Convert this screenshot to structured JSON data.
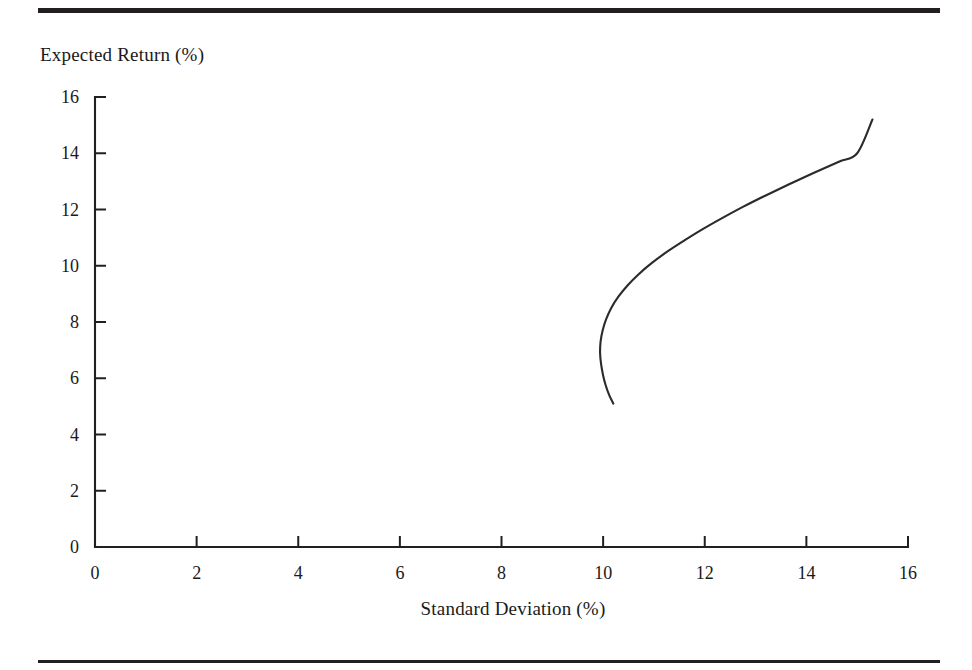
{
  "figure": {
    "top_rule": "horizontal-rule",
    "bottom_rule": "horizontal-rule",
    "y_axis_title": "Expected Return (%)",
    "x_axis_title": "Standard Deviation (%)"
  },
  "chart_data": {
    "type": "line",
    "title": "",
    "subtitle": "",
    "xlabel": "Standard Deviation (%)",
    "ylabel": "Expected Return (%)",
    "xlim": [
      0,
      16
    ],
    "ylim": [
      0,
      16
    ],
    "xticks": [
      0,
      2,
      4,
      6,
      8,
      10,
      12,
      14,
      16
    ],
    "yticks": [
      0,
      2,
      4,
      6,
      8,
      10,
      12,
      14,
      16
    ],
    "xtick_labels": [
      "0",
      "2",
      "4",
      "6",
      "8",
      "10",
      "12",
      "14",
      "16"
    ],
    "ytick_labels": [
      "0",
      "2",
      "4",
      "6",
      "8",
      "10",
      "12",
      "14",
      "16"
    ],
    "grid": false,
    "legend": null,
    "legend_position": "none",
    "tick_direction": "out",
    "series": [
      {
        "name": "Minimum-variance frontier",
        "color": "#2b2b2b",
        "linewidth": 2.1,
        "x": [
          10.2,
          10.12,
          10.05,
          10.0,
          9.96,
          9.94,
          9.95,
          9.99,
          10.06,
          10.16,
          10.3,
          10.48,
          10.7,
          10.96,
          11.26,
          11.6,
          11.96,
          12.35,
          12.76,
          13.2,
          13.66,
          14.14,
          14.64,
          15.0,
          15.3
        ],
        "y": [
          5.1,
          5.4,
          5.75,
          6.1,
          6.5,
          6.9,
          7.3,
          7.7,
          8.1,
          8.5,
          8.9,
          9.3,
          9.7,
          10.1,
          10.5,
          10.9,
          11.3,
          11.7,
          12.1,
          12.5,
          12.9,
          13.3,
          13.7,
          14.0,
          15.2
        ]
      }
    ],
    "annotations": [],
    "notes": {
      "minimum_variance_point": {
        "x": 9.94,
        "y": 7.0
      },
      "lower_branch_endpoint": {
        "x": 10.2,
        "y": 5.1
      },
      "upper_branch_endpoint": {
        "x": 15.3,
        "y": 15.2
      }
    }
  }
}
